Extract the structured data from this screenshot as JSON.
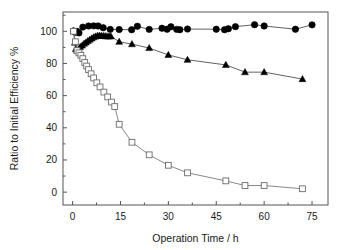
{
  "chart_data": {
    "type": "scatter",
    "title": "",
    "xlabel": "Operation Time / h",
    "ylabel": "Ratio to Initial Efficiency %",
    "xlim": [
      -3,
      80
    ],
    "ylim": [
      -8,
      112
    ],
    "xticks": [
      0,
      15,
      30,
      45,
      60,
      75
    ],
    "yticks": [
      0,
      20,
      40,
      60,
      80,
      100
    ],
    "xtick_labels": [
      "0",
      "15",
      "30",
      "45",
      "60",
      "75"
    ],
    "ytick_labels": [
      "0",
      "20",
      "40",
      "60",
      "80",
      "100"
    ],
    "grid": false,
    "legend": "none",
    "series": [
      {
        "name": "filled-circles",
        "marker": "circle",
        "filled": true,
        "color": "#000000",
        "line_color": "#3a3a3a",
        "points": [
          [
            0.3,
            100.2
          ],
          [
            0.8,
            99.4
          ],
          [
            1.3,
            100.0
          ],
          [
            2.0,
            99.0
          ],
          [
            3.2,
            102.6
          ],
          [
            5.0,
            103.3
          ],
          [
            6.6,
            103.4
          ],
          [
            8.0,
            103.3
          ],
          [
            9.6,
            102.2
          ],
          [
            11.8,
            101.2
          ],
          [
            14.6,
            101.1
          ],
          [
            18.5,
            101.0
          ],
          [
            20.3,
            103.1
          ],
          [
            24.0,
            101.2
          ],
          [
            28.0,
            101.9
          ],
          [
            29.6,
            101.3
          ],
          [
            30.8,
            102.8
          ],
          [
            32.6,
            101.2
          ],
          [
            33.6,
            101.0
          ],
          [
            36.0,
            101.4
          ],
          [
            45.0,
            101.3
          ],
          [
            47.6,
            101.0
          ],
          [
            48.8,
            101.6
          ],
          [
            51.0,
            102.9
          ],
          [
            57.0,
            104.1
          ],
          [
            60.0,
            103.3
          ],
          [
            69.8,
            101.3
          ],
          [
            75.0,
            104.0
          ]
        ]
      },
      {
        "name": "filled-triangles",
        "marker": "triangle",
        "filled": true,
        "color": "#000000",
        "line_color": "#3a3a3a",
        "points": [
          [
            0.3,
            100.1
          ],
          [
            0.7,
            93.0
          ],
          [
            1.0,
            89.0
          ],
          [
            1.4,
            88.2
          ],
          [
            1.9,
            88.6
          ],
          [
            2.4,
            90.3
          ],
          [
            3.0,
            91.2
          ],
          [
            3.6,
            92.3
          ],
          [
            4.2,
            93.1
          ],
          [
            4.8,
            94.0
          ],
          [
            5.4,
            94.8
          ],
          [
            6.0,
            95.6
          ],
          [
            6.6,
            96.3
          ],
          [
            7.2,
            96.8
          ],
          [
            7.8,
            97.2
          ],
          [
            8.4,
            97.3
          ],
          [
            9.0,
            97.2
          ],
          [
            9.6,
            97.1
          ],
          [
            10.2,
            97.0
          ],
          [
            10.8,
            96.9
          ],
          [
            11.4,
            96.8
          ],
          [
            12.0,
            96.9
          ],
          [
            14.6,
            93.5
          ],
          [
            18.6,
            92.0
          ],
          [
            24.0,
            89.6
          ],
          [
            30.0,
            85.3
          ],
          [
            36.0,
            82.3
          ],
          [
            48.0,
            79.1
          ],
          [
            54.0,
            74.6
          ],
          [
            60.0,
            74.6
          ],
          [
            72.0,
            70.3
          ]
        ]
      },
      {
        "name": "open-squares",
        "marker": "square",
        "filled": false,
        "color": "#6b6b6b",
        "line_color": "#6b6b6b",
        "points": [
          [
            0.3,
            100.0
          ],
          [
            0.9,
            93.5
          ],
          [
            1.4,
            88.0
          ],
          [
            2.0,
            86.6
          ],
          [
            2.6,
            85.1
          ],
          [
            3.2,
            83.0
          ],
          [
            3.8,
            80.6
          ],
          [
            4.4,
            78.4
          ],
          [
            5.0,
            76.2
          ],
          [
            5.8,
            73.6
          ],
          [
            6.6,
            71.0
          ],
          [
            7.6,
            68.0
          ],
          [
            8.6,
            65.4
          ],
          [
            9.8,
            62.2
          ],
          [
            11.0,
            59.2
          ],
          [
            12.2,
            56.0
          ],
          [
            13.2,
            53.2
          ],
          [
            14.6,
            42.2
          ],
          [
            18.6,
            31.0
          ],
          [
            24.0,
            23.2
          ],
          [
            30.0,
            16.7
          ],
          [
            36.0,
            12.0
          ],
          [
            48.0,
            7.0
          ],
          [
            54.0,
            4.1
          ],
          [
            60.0,
            4.1
          ],
          [
            72.0,
            2.1
          ]
        ]
      }
    ]
  },
  "axes": {
    "xlabel": "Operation Time / h",
    "ylabel": "Ratio to Initial Efficiency %"
  }
}
